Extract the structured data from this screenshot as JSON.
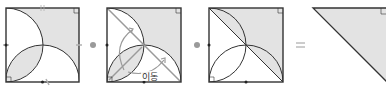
{
  "diagram": {
    "panels": [
      {
        "id": "step-1",
        "description": "square with two quarter-circle arcs, shaded region"
      },
      {
        "id": "step-2",
        "description": "square with diagonal, arcs and move arrows",
        "label": "이동"
      },
      {
        "id": "step-3",
        "description": "square with diagonal, shaded half-lens regions"
      },
      {
        "id": "result",
        "description": "shaded right triangle"
      }
    ],
    "operators": [
      "➡",
      "➡",
      "="
    ],
    "move_label": "이동",
    "equals_label": "=",
    "colors": {
      "stroke": "#333333",
      "shade": "#e3e3e3",
      "guide": "#9a9a9a",
      "tick": "#b0b0b0"
    }
  }
}
